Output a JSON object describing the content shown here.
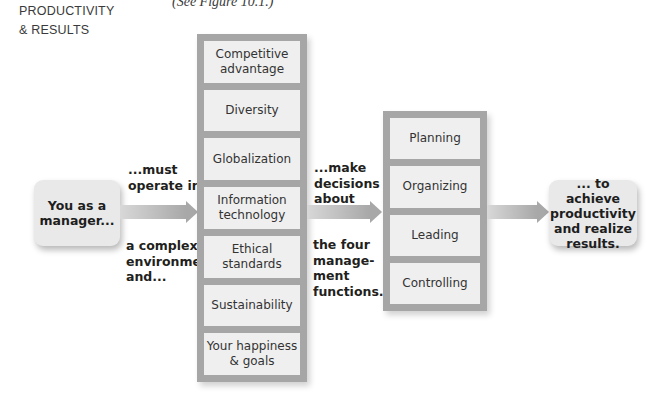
{
  "side_label": {
    "line1": "PRODUCTIVITY",
    "line2": "& RESULTS"
  },
  "figure_ref": "(See Figure 10.1.)",
  "start_box": {
    "line1": "You as a",
    "line2": "manager..."
  },
  "note_operate": {
    "line1": "...must",
    "line2": "operate in"
  },
  "note_environment": {
    "line1": "a complex",
    "line2": "environment",
    "line3": "and..."
  },
  "environment_column": {
    "items": [
      {
        "line1": "Competitive",
        "line2": "advantage"
      },
      {
        "line1": "Diversity",
        "line2": ""
      },
      {
        "line1": "Globalization",
        "line2": ""
      },
      {
        "line1": "Information",
        "line2": "technology"
      },
      {
        "line1": "Ethical",
        "line2": "standards"
      },
      {
        "line1": "Sustainability",
        "line2": ""
      },
      {
        "line1": "Your happiness",
        "line2": "& goals"
      }
    ]
  },
  "note_decisions": {
    "line1": "...make",
    "line2": "decisions",
    "line3": "about"
  },
  "note_functions": {
    "line1": "the four",
    "line2": "manage-",
    "line3": "ment",
    "line4": "functions..."
  },
  "functions_column": {
    "items": [
      {
        "label": "Planning"
      },
      {
        "label": "Organizing"
      },
      {
        "label": "Leading"
      },
      {
        "label": "Controlling"
      }
    ]
  },
  "end_box": {
    "line1": "... to achieve",
    "line2": "productivity",
    "line3": "and realize",
    "line4": "results."
  },
  "colors": {
    "column_frame": "#a6a6a6",
    "cell_fill": "#efefef",
    "box_fill": "#e9e9e9",
    "arrow": "#a8a8a8"
  }
}
